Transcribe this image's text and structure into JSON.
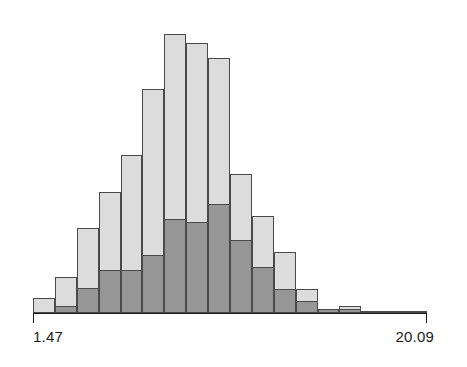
{
  "chart_data": {
    "type": "bar",
    "title": "",
    "subtitle": "",
    "xlabel": "",
    "ylabel": "",
    "grid": false,
    "legend": null,
    "axis_min_label": "1.47",
    "axis_max_label": "20.09",
    "xlim": [
      1.47,
      20.09
    ],
    "ylim": [
      0,
      100
    ],
    "stacked": true,
    "bin_count": 18,
    "categories": [
      "bin-1",
      "bin-2",
      "bin-3",
      "bin-4",
      "bin-5",
      "bin-6",
      "bin-7",
      "bin-8",
      "bin-9",
      "bin-10",
      "bin-11",
      "bin-12",
      "bin-13",
      "bin-14",
      "bin-15",
      "bin-16",
      "bin-17",
      "bin-18"
    ],
    "series": [
      {
        "name": "dark-segment",
        "color": "#969696",
        "values": [
          0,
          2,
          8,
          14,
          14,
          19,
          31,
          30,
          36,
          24,
          15,
          8,
          4,
          1.2,
          1.2,
          0.6,
          0.6,
          0.3
        ]
      },
      {
        "name": "light-segment",
        "color": "#dcdcdc",
        "values": [
          5,
          10,
          20,
          26,
          38,
          55,
          61,
          59,
          48,
          22,
          17,
          12,
          4,
          0,
          1.2,
          0,
          0,
          0
        ]
      }
    ],
    "totals": [
      5,
      12,
      28,
      40,
      52,
      74,
      92,
      89,
      84,
      46,
      32,
      20,
      8,
      1.2,
      2.4,
      0.6,
      0.6,
      0.3
    ],
    "colors": {
      "light": "#dcdcdc",
      "dark": "#969696",
      "outline": "#4a4a4a",
      "axis": "#1c1c1c",
      "background": "#ffffff"
    }
  },
  "axis": {
    "left_label": "1.47",
    "right_label": "20.09"
  }
}
